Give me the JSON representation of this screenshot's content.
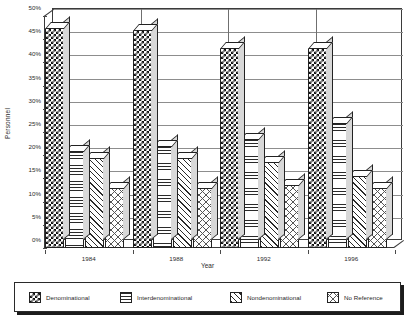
{
  "chart_data": {
    "type": "bar",
    "title": "",
    "subtitle": "",
    "xlabel": "Year",
    "ylabel": "Personnel",
    "categories": [
      "1984",
      "1988",
      "1992",
      "1996"
    ],
    "ylim": [
      0,
      50
    ],
    "ytick_labels": [
      "0%",
      "5%",
      "10%",
      "15%",
      "20%",
      "25%",
      "30%",
      "35%",
      "40%",
      "45%",
      "50%"
    ],
    "ytick_values": [
      0,
      5,
      10,
      15,
      20,
      25,
      30,
      35,
      40,
      45,
      50
    ],
    "grid": true,
    "legend_position": "bottom",
    "value_suffix": "%",
    "series": [
      {
        "name": "Denominational",
        "pattern": "checker",
        "values": [
          47.5,
          47.0,
          43.0,
          43.0
        ]
      },
      {
        "name": "Interdenominational",
        "pattern": "hlines",
        "values": [
          21.0,
          22.0,
          23.5,
          27.0
        ]
      },
      {
        "name": "Nondenominational",
        "pattern": "diag",
        "values": [
          19.5,
          19.5,
          18.5,
          15.5
        ]
      },
      {
        "name": "No Reference",
        "pattern": "cross",
        "values": [
          13.0,
          13.0,
          13.5,
          13.0
        ]
      }
    ]
  },
  "legend": {
    "items": [
      {
        "label": "Denominational"
      },
      {
        "label": "Interdenominational"
      },
      {
        "label": "Nondenominational"
      },
      {
        "label": "No Reference"
      }
    ]
  },
  "colors": {
    "axis": "#3b3b3b",
    "gridline": "#8d8d8d",
    "text": "#2b2b2b",
    "plot_background": "#ffffff",
    "page_background": "#ffffff",
    "legend_border": "#2a2a2a",
    "legend_shadow": "#1c1c1c"
  }
}
